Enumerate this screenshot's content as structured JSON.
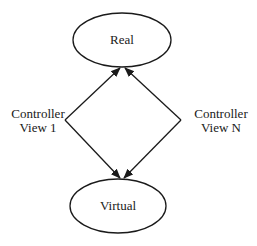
{
  "diagram": {
    "type": "flow",
    "nodes": {
      "top": {
        "id": "real",
        "label": "Real",
        "shape": "ellipse"
      },
      "bottom": {
        "id": "virtual",
        "label": "Virtual",
        "shape": "ellipse"
      }
    },
    "edges": [
      {
        "from": "controller-view-1",
        "to": "real",
        "arrow": "filled"
      },
      {
        "from": "controller-view-1",
        "to": "virtual",
        "arrow": "filled"
      },
      {
        "from": "controller-view-n",
        "to": "real",
        "arrow": "filled"
      },
      {
        "from": "controller-view-n",
        "to": "virtual",
        "arrow": "filled"
      }
    ],
    "labels": {
      "left": {
        "line1": "Controller",
        "line2": "View 1"
      },
      "right": {
        "line1": "Controller",
        "line2": "View N"
      }
    },
    "colors": {
      "stroke": "#1a1a1a",
      "background": "#ffffff"
    }
  }
}
